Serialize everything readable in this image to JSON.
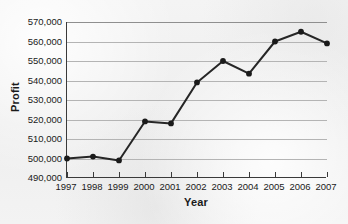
{
  "chart_data": {
    "type": "line",
    "title": "",
    "xlabel": "Year",
    "ylabel": "Profit",
    "categories": [
      "1997",
      "1998",
      "1999",
      "2000",
      "2001",
      "2002",
      "2003",
      "2004",
      "2005",
      "2006",
      "2007"
    ],
    "values": [
      500000,
      501000,
      499000,
      519000,
      518000,
      539000,
      550000,
      543500,
      560000,
      565000,
      559000
    ],
    "series": [
      {
        "name": "Profit",
        "values": [
          500000,
          501000,
          499000,
          519000,
          518000,
          539000,
          550000,
          543500,
          560000,
          565000,
          559000
        ]
      }
    ],
    "ylim": [
      490000,
      570000
    ],
    "ytick_values": [
      490000,
      500000,
      510000,
      520000,
      530000,
      540000,
      550000,
      560000,
      570000
    ],
    "ytick_labels": [
      "490,000",
      "500,000",
      "510,000",
      "520,000",
      "530,000",
      "540,000",
      "550,000",
      "560,000",
      "570,000"
    ],
    "grid": true,
    "legend": "none",
    "marker": "filled-circle",
    "line_color": "#262626",
    "marker_color": "#1a1a1a",
    "grid_color": "#b4b4b4",
    "axis_color": "#3a3a3a",
    "background_color": "#f1f1f1"
  }
}
